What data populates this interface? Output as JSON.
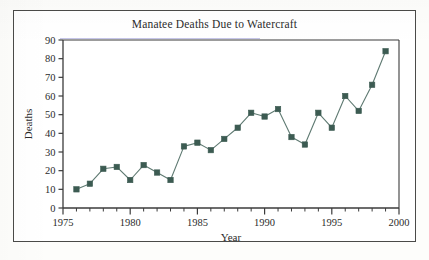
{
  "figure": {
    "title": "Manatee Deaths Due to Watercraft",
    "border_color": "#4a4a48",
    "background": "#ffffff"
  },
  "chart_data": {
    "type": "line",
    "title": "Manatee Deaths Due to Watercraft",
    "xlabel": "Year",
    "ylabel": "Deaths",
    "xlim": [
      1975,
      2000
    ],
    "ylim": [
      0,
      90
    ],
    "xticks": [
      1975,
      1980,
      1985,
      1990,
      1995,
      2000
    ],
    "xtick_labels": [
      "1975",
      "1980",
      "1985",
      "1990",
      "1995",
      "2000"
    ],
    "yticks": [
      0,
      10,
      20,
      30,
      40,
      50,
      60,
      70,
      80,
      90
    ],
    "ytick_labels": [
      "0",
      "10",
      "20",
      "30",
      "40",
      "50",
      "60",
      "70",
      "80",
      "90"
    ],
    "minor_xtick_interval": 1,
    "grid": false,
    "legend": false,
    "marker": "square",
    "marker_color": "#3c5b52",
    "line_color": "#5f7a72",
    "x": [
      1976,
      1977,
      1978,
      1979,
      1980,
      1981,
      1982,
      1983,
      1984,
      1985,
      1986,
      1987,
      1988,
      1989,
      1990,
      1991,
      1992,
      1993,
      1994,
      1995,
      1996,
      1997,
      1998,
      1999
    ],
    "values": [
      10,
      13,
      21,
      22,
      15,
      23,
      19,
      15,
      33,
      35,
      31,
      37,
      43,
      51,
      49,
      53,
      38,
      34,
      51,
      43,
      60,
      52,
      66,
      84
    ],
    "series": [
      {
        "name": "Manatee deaths",
        "x": [
          1976,
          1977,
          1978,
          1979,
          1980,
          1981,
          1982,
          1983,
          1984,
          1985,
          1986,
          1987,
          1988,
          1989,
          1990,
          1991,
          1992,
          1993,
          1994,
          1995,
          1996,
          1997,
          1998,
          1999
        ],
        "values": [
          10,
          13,
          21,
          22,
          15,
          23,
          19,
          15,
          33,
          35,
          31,
          37,
          43,
          51,
          49,
          53,
          38,
          34,
          51,
          43,
          60,
          52,
          66,
          84
        ]
      }
    ]
  }
}
